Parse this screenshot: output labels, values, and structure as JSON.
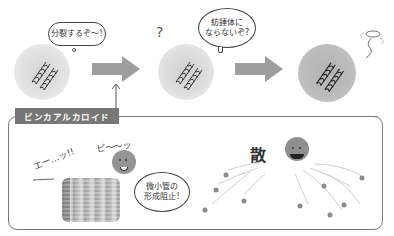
{
  "top_row": {
    "cell1_bubble": "分裂するぞ〜!",
    "cell2_question": "?",
    "cell2_bubble_line1": "紡錘体に",
    "cell2_bubble_line2": "ならないぞ?",
    "cell3_halo": "halo-spirit-doodle"
  },
  "drug_label": "ビンカアルカロイド",
  "bottom_panel": {
    "exclaim": "エー…ッ!!",
    "sound": "ピ〜〜ッ",
    "bubble_line1": "微小管の",
    "bubble_line2": "形成阻止!",
    "scatter_kanji": "散"
  },
  "colors": {
    "cell_light": "#d9d9d9",
    "cell_mid": "#c8c8c8",
    "cell_dark": "#a8a8a8",
    "arrow": "#9e9e9e",
    "label_bg": "#777777",
    "panel_border": "#777777",
    "drug_ball": "#8f8f8f",
    "fragments": "#8a8a8a"
  }
}
